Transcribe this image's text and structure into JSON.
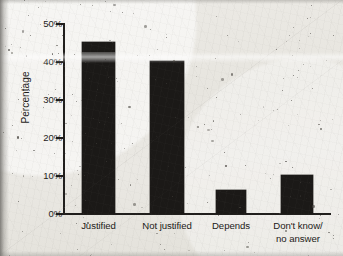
{
  "chart_data": {
    "type": "bar",
    "title": "",
    "xlabel": "",
    "ylabel": "Percentage",
    "categories": [
      "Justified",
      "Not justified",
      "Depends",
      "Don't know/\nno answer"
    ],
    "values": [
      45,
      40,
      6,
      10
    ],
    "ylim": [
      0,
      50
    ],
    "yticks": [
      0,
      10,
      20,
      30,
      40,
      50
    ],
    "ytick_labels": [
      "0%",
      "10%",
      "20%",
      "30%",
      "40%",
      "50%"
    ],
    "grid": false,
    "legend": null,
    "bar_color": "#1b1917",
    "axis_color": "#201e1c",
    "background_color": "#e9e7e2"
  },
  "axis": {
    "y_title": "Percentage",
    "tick_0": "0%",
    "tick_1": "10%",
    "tick_2": "20%",
    "tick_3": "30%",
    "tick_4": "40%",
    "tick_5": "50%"
  },
  "bars": {
    "b0_label": "Justified",
    "b1_label": "Not justified",
    "b2_label": "Depends",
    "b3_label": "Don't know/\nno answer"
  }
}
